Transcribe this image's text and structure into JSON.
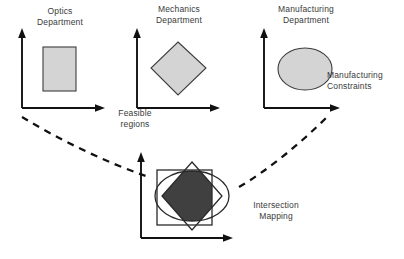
{
  "diagram": {
    "title_present": false,
    "background_color": "#ffffff",
    "fill_light": "#d4d4d4",
    "fill_dark": "#404040",
    "outline_color": "#3d3d3d",
    "axis_color": "#111111",
    "text_color": "#3a3a3a"
  },
  "panels": [
    {
      "id": "optics",
      "label_line1": "Optics",
      "label_line2": "Department",
      "shape": "rectangle",
      "shape_name": "optics-feasible-region"
    },
    {
      "id": "mechanics",
      "label_line1": "Mechanics",
      "label_line2": "Department",
      "shape": "diamond",
      "shape_name": "mechanics-feasible-region"
    },
    {
      "id": "manufacturing",
      "label_line1": "Manufacturing",
      "label_line2": "Department",
      "shape": "ellipse",
      "shape_name": "manufacturing-feasible-region"
    }
  ],
  "annotations": {
    "feasible_regions_line1": "Feasible",
    "feasible_regions_line2": "regions",
    "manufacturing_constraints_line1": "Manufacturing",
    "manufacturing_constraints_line2": "Constraints",
    "intersection_mapping_line1": "Intersection",
    "intersection_mapping_line2": "Mapping"
  },
  "intersection_panel": {
    "id": "intersection",
    "shapes": [
      "rectangle",
      "diamond",
      "ellipse"
    ],
    "filled_region": "intersection-of-all-three"
  }
}
